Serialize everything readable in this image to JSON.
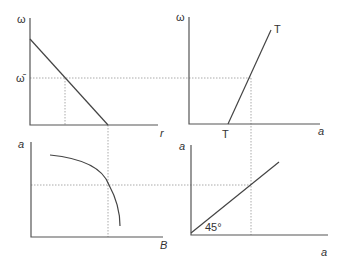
{
  "diagram": {
    "type": "four-quadrant",
    "colors": {
      "axis": "#555555",
      "curve": "#444444",
      "guide": "#aaaaaa",
      "text": "#333333"
    },
    "panels": [
      {
        "id": "top-left",
        "y_label": "ω",
        "x_label": "r",
        "y_tick_label": "ω̄",
        "curve": "downward-sloping line"
      },
      {
        "id": "top-right",
        "y_label": "ω",
        "x_label": "a",
        "curve_label_top": "T",
        "curve_label_bottom": "T",
        "curve": "upward-sloping line TT"
      },
      {
        "id": "bottom-left",
        "y_label": "a",
        "x_label": "B",
        "curve": "concave frontier"
      },
      {
        "id": "bottom-right",
        "y_label": "a",
        "x_label": "a",
        "angle_label": "45°",
        "curve": "45-degree line"
      }
    ]
  }
}
